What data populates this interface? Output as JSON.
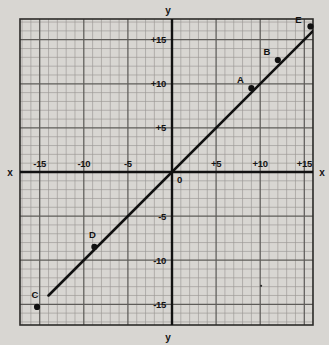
{
  "figure": {
    "paper_color": "#d8d6d2",
    "grid_color": "#9a9894",
    "major_grid_color": "#5e5c59",
    "ink_color": "#111111",
    "axis_labels": {
      "x_left": "x",
      "x_right": "x",
      "y_top": "y",
      "y_bottom": "y",
      "origin": "0"
    },
    "x_ticks": [
      {
        "label": "-15",
        "value": -15
      },
      {
        "label": "-10",
        "value": -10
      },
      {
        "label": "-5",
        "value": -5
      },
      {
        "label": "+5",
        "value": 5
      },
      {
        "label": "+10",
        "value": 10
      },
      {
        "label": "+15",
        "value": 15
      }
    ],
    "y_ticks": [
      {
        "label": "+15",
        "value": 15
      },
      {
        "label": "+10",
        "value": 10
      },
      {
        "label": "+5",
        "value": 5
      },
      {
        "label": "-5",
        "value": -5
      },
      {
        "label": "-10",
        "value": -10
      },
      {
        "label": "-15",
        "value": -15
      }
    ]
  },
  "chart_data": {
    "type": "line",
    "title": "",
    "xlabel": "x",
    "ylabel": "y",
    "xlim": [
      -16.5,
      16.5
    ],
    "ylim": [
      -17.5,
      17.5
    ],
    "grid": true,
    "minor_grid_step": 1,
    "major_grid_step": 5,
    "legend": "none",
    "series": [
      {
        "name": "y = x",
        "x": [
          -14,
          16
        ],
        "values": [
          -14,
          16
        ],
        "style": "solid",
        "color": "#111111"
      }
    ],
    "points": [
      {
        "label": "A",
        "x": 9,
        "y": 9.5,
        "label_dx": -11,
        "label_dy": -5
      },
      {
        "label": "B",
        "x": 12,
        "y": 12.7,
        "label_dx": -11,
        "label_dy": -5
      },
      {
        "label": "C",
        "x": -15.3,
        "y": -15.3,
        "label_dx": -2,
        "label_dy": -9
      },
      {
        "label": "D",
        "x": -8.8,
        "y": -8.5,
        "label_dx": -2,
        "label_dy": -9
      },
      {
        "label": "E",
        "x": 15.7,
        "y": 16.5,
        "label_dx": -12,
        "label_dy": -3
      }
    ],
    "annotations": [
      {
        "type": "speck",
        "x": 10.1,
        "y": -12.9
      }
    ]
  }
}
